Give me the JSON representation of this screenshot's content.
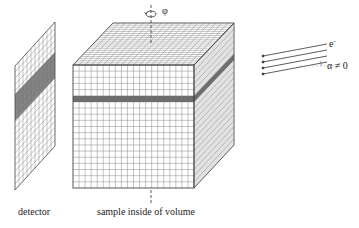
{
  "diagram": {
    "labels": {
      "detector": "detector",
      "sample": "sample inside of volume",
      "rotation": "φ",
      "beam": "e",
      "beam_superscript": "-",
      "angle": "α ≠ 0"
    },
    "grid": {
      "front_cols": 20,
      "front_rows": 20,
      "detector_cols": 10,
      "detector_rows": 20
    },
    "colors": {
      "grid_line": "#8a8a8a",
      "outline": "#444444",
      "band": "#6e6e6e",
      "text": "#222222"
    }
  }
}
